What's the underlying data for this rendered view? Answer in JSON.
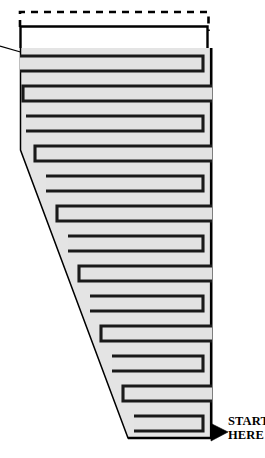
{
  "figure": {
    "type": "maze",
    "colors": {
      "background": "#ffffff",
      "fill": "#e3e3e3",
      "stroke": "#000000",
      "wall": "#1a1a1a"
    },
    "canvas": {
      "width": 265,
      "height": 458
    }
  },
  "labels": {
    "start": {
      "line1": "START",
      "line2": "HERE"
    }
  },
  "icons": {
    "start_arrow": "left-pointing-triangle"
  },
  "geometry": {
    "outline": {
      "description": "Trapezoid body: vertical left wall from top down, then diagonal to bottom-right, flat bottom, vertical right wall.",
      "points": [
        [
          20,
          48
        ],
        [
          20,
          150
        ],
        [
          128,
          438
        ],
        [
          212,
          438
        ],
        [
          212,
          48
        ]
      ]
    },
    "top_open_channel": {
      "description": "Solid entry channel above body, open at left side",
      "points": [
        [
          0,
          46
        ],
        [
          20,
          46
        ],
        [
          20,
          26
        ],
        [
          208,
          26
        ],
        [
          208,
          48
        ]
      ]
    },
    "dashed_channel": {
      "description": "Dashed rectangle open at left, above the solid entry channel",
      "points": [
        [
          20,
          26
        ],
        [
          20,
          12
        ],
        [
          208,
          12
        ],
        [
          208,
          30
        ]
      ],
      "dash": "7 6"
    },
    "left_notch": {
      "from": [
        0,
        46
      ],
      "to": [
        20,
        52
      ]
    },
    "bar_count": 13,
    "bar_pitch": 29.7,
    "bar_height": 15,
    "bar_first_top": 56,
    "right_edge_x": 212,
    "bars": [
      {
        "index": 1,
        "y": 56,
        "anchor": "left",
        "x1": 20,
        "x2": 203
      },
      {
        "index": 2,
        "y": 86,
        "anchor": "right",
        "x1": 23,
        "x2": 212
      },
      {
        "index": 3,
        "y": 116,
        "anchor": "left",
        "x1": 26,
        "x2": 203
      },
      {
        "index": 4,
        "y": 146,
        "anchor": "right",
        "x1": 35,
        "x2": 212
      },
      {
        "index": 5,
        "y": 176,
        "anchor": "left",
        "x1": 46,
        "x2": 203
      },
      {
        "index": 6,
        "y": 206,
        "anchor": "right",
        "x1": 57,
        "x2": 212
      },
      {
        "index": 7,
        "y": 236,
        "anchor": "left",
        "x1": 68,
        "x2": 203
      },
      {
        "index": 8,
        "y": 266,
        "anchor": "right",
        "x1": 79,
        "x2": 212
      },
      {
        "index": 9,
        "y": 296,
        "anchor": "left",
        "x1": 90,
        "x2": 203
      },
      {
        "index": 10,
        "y": 326,
        "anchor": "right",
        "x1": 101,
        "x2": 212
      },
      {
        "index": 11,
        "y": 356,
        "anchor": "left",
        "x1": 112,
        "x2": 203
      },
      {
        "index": 12,
        "y": 386,
        "anchor": "right",
        "x1": 123,
        "x2": 212
      },
      {
        "index": 13,
        "y": 416,
        "anchor": "left",
        "x1": 134,
        "x2": 203
      }
    ],
    "start_marker": {
      "triangle": [
        [
          228,
          432
        ],
        [
          212,
          424
        ],
        [
          212,
          441
        ]
      ]
    }
  }
}
